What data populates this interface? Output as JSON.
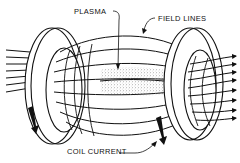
{
  "diagram": {
    "labels": {
      "plasma": "PLASMA",
      "field_lines": "FIELD LINES",
      "coil_current": "COIL CURRENT"
    },
    "elements": {
      "left_coil": "left-coil-ring",
      "right_coil": "right-coil-ring",
      "plasma_region": "stippled-plasma-column",
      "incoming_field_lines": 8,
      "outgoing_field_lines": 8,
      "current_arrows": 2
    },
    "colors": {
      "ink": "#111111",
      "background": "#ffffff",
      "plasma_stipple": "#555555"
    }
  }
}
